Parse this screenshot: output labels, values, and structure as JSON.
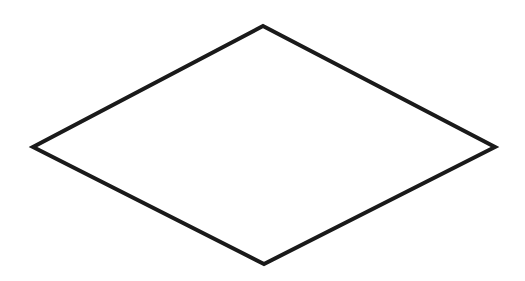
{
  "diagram": {
    "width": 525,
    "height": 281,
    "background": "#ffffff",
    "shapes": [
      {
        "type": "diamond",
        "label": "",
        "points": [
          [
            263,
            26
          ],
          [
            495,
            147
          ],
          [
            264,
            264
          ],
          [
            33,
            147
          ]
        ],
        "stroke": "#1a1a1a",
        "stroke_width": 4,
        "fill": "#ffffff"
      }
    ]
  }
}
